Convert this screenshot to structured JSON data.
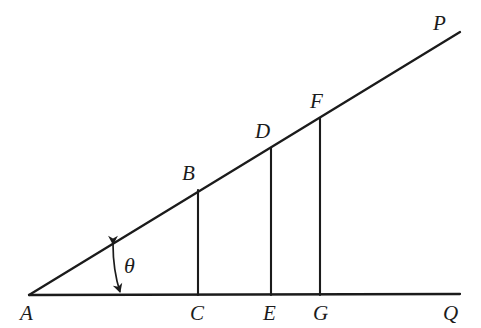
{
  "figure": {
    "type": "geometry-diagram",
    "background_color": "#ffffff",
    "stroke_color": "#1b1b1b",
    "canvas": {
      "width": 481,
      "height": 328
    }
  },
  "labels": {
    "A": "A",
    "B": "B",
    "C": "C",
    "D": "D",
    "E": "E",
    "F": "F",
    "G": "G",
    "P": "P",
    "Q": "Q",
    "theta": "θ"
  },
  "geometry": {
    "points": {
      "A": {
        "x": 29,
        "y": 295
      },
      "B": {
        "x": 198,
        "y": 190
      },
      "C": {
        "x": 198,
        "y": 295
      },
      "D": {
        "x": 271,
        "y": 148
      },
      "E": {
        "x": 271,
        "y": 295
      },
      "F": {
        "x": 320,
        "y": 118
      },
      "G": {
        "x": 320,
        "y": 295
      },
      "P": {
        "x": 460,
        "y": 32
      },
      "Q": {
        "x": 460,
        "y": 294
      }
    },
    "label_positions": {
      "A": {
        "x": 20,
        "y": 303
      },
      "B": {
        "x": 182,
        "y": 163
      },
      "C": {
        "x": 190,
        "y": 303
      },
      "D": {
        "x": 255,
        "y": 121
      },
      "E": {
        "x": 263,
        "y": 303
      },
      "F": {
        "x": 310,
        "y": 91
      },
      "G": {
        "x": 313,
        "y": 303
      },
      "P": {
        "x": 433,
        "y": 13
      },
      "Q": {
        "x": 443,
        "y": 303
      },
      "theta": {
        "x": 124,
        "y": 255
      }
    },
    "segments": [
      {
        "name": "ray-AP",
        "from": "A",
        "to": "P"
      },
      {
        "name": "ray-AQ",
        "from": "A",
        "to": "Q"
      },
      {
        "name": "segment-BC",
        "from": "B",
        "to": "C"
      },
      {
        "name": "segment-DE",
        "from": "D",
        "to": "E"
      },
      {
        "name": "segment-FG",
        "from": "F",
        "to": "G"
      }
    ],
    "angle_arrow": {
      "name": "theta-double-arrow",
      "start": {
        "x": 113,
        "y": 244
      },
      "control": {
        "x": 113,
        "y": 270
      },
      "end": {
        "x": 120,
        "y": 292
      }
    }
  }
}
